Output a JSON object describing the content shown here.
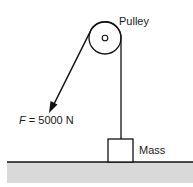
{
  "diagram": {
    "type": "pulley-force-diagram",
    "labels": {
      "pulley": "Pulley",
      "force_symbol": "F",
      "force_value": " = 5000 N",
      "mass": "Mass"
    },
    "components": [
      {
        "id": "pulley",
        "description": "Fixed pulley wheel with central axle"
      },
      {
        "id": "rope",
        "description": "Rope passing over pulley, one end attached to mass, other end pulled"
      },
      {
        "id": "force",
        "description": "Applied pulling force arrow",
        "magnitude": 5000,
        "unit": "N"
      },
      {
        "id": "mass",
        "description": "Box resting on ground"
      },
      {
        "id": "ground",
        "description": "Shaded ground surface"
      }
    ],
    "colors": {
      "stroke": "#111111",
      "ground_fill": "#d9d9d9",
      "background": "#ffffff"
    }
  }
}
